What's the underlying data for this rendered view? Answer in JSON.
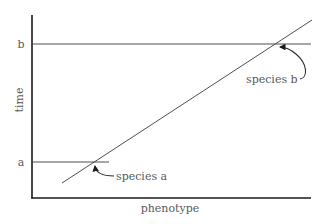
{
  "diagram": {
    "x_axis_label": "phenotype",
    "y_axis_label": "time",
    "y_ticks": [
      {
        "label": "b",
        "y": 44
      },
      {
        "label": "a",
        "y": 162
      }
    ],
    "annotations": [
      {
        "label": "species a",
        "points_to": "intersection of lineage line with time a"
      },
      {
        "label": "species b",
        "points_to": "intersection of lineage line with time b"
      }
    ],
    "colors": {
      "axis": "#1a1a1a",
      "lines": "#3a3a3a",
      "text": "#5a5a5a",
      "background": "#ffffff"
    }
  }
}
